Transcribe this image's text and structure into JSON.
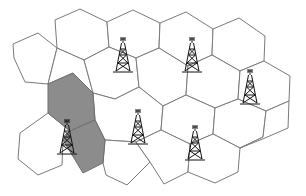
{
  "diagram": {
    "title": "",
    "colors": {
      "cell_fill": "#ffffff",
      "cell_stroke": "#7a7a7a",
      "shaded_fill": "#8c8c8c",
      "tower": "#111111"
    },
    "cells": [
      {
        "id": "c1",
        "points": "55,20 80,9 107,22 109,47 84,60 57,48",
        "shaded": false
      },
      {
        "id": "c2",
        "points": "107,22 133,10 160,23 159,48 136,58 109,47",
        "shaded": false
      },
      {
        "id": "c3",
        "points": "160,23 186,12 213,29 212,55 188,66 159,48",
        "shaded": false
      },
      {
        "id": "c4",
        "points": "213,29 239,18 265,36 264,61 240,71 212,55",
        "shaded": false
      },
      {
        "id": "c5",
        "points": "13,44 38,33 57,48 48,84 25,82 14,58",
        "shaded": false
      },
      {
        "id": "c6",
        "points": "57,48 84,60 93,93 73,73 48,84",
        "shaded": false
      },
      {
        "id": "c7",
        "points": "84,60 109,47 136,58 139,87 115,99 93,93",
        "shaded": false
      },
      {
        "id": "c8",
        "points": "136,58 159,48 188,66 186,95 163,106 139,87",
        "shaded": false
      },
      {
        "id": "c9",
        "points": "188,66 212,55 240,71 238,99 215,108 186,95",
        "shaded": false
      },
      {
        "id": "c10",
        "points": "240,71 264,61 290,76 289,101 266,111 238,99",
        "shaded": false
      },
      {
        "id": "c11",
        "points": "48,84 73,73 93,93 95,120 70,131 48,113",
        "shaded": true
      },
      {
        "id": "c12",
        "points": "95,120 70,131 63,140 83,173 103,163 105,140",
        "shaded": true
      },
      {
        "id": "c13",
        "points": "20,133 48,113 70,131 63,140 62,165 38,175 18,159",
        "shaded": false
      },
      {
        "id": "c14",
        "points": "93,93 115,99 139,87 163,106 161,130 136,142 105,140 95,120",
        "shaded": false
      },
      {
        "id": "c15",
        "points": "163,106 186,95 215,108 213,134 190,144 161,130",
        "shaded": false
      },
      {
        "id": "c16",
        "points": "215,108 238,99 266,111 263,137 240,148 213,134",
        "shaded": false
      },
      {
        "id": "c17",
        "points": "105,140 136,142 150,162 127,185 106,175 103,163",
        "shaded": false
      },
      {
        "id": "c18",
        "points": "136,142 161,130 190,144 188,172 164,184 150,162",
        "shaded": false
      },
      {
        "id": "c19",
        "points": "190,144 213,134 240,148 238,172 215,183 188,172",
        "shaded": false
      },
      {
        "id": "c20",
        "points": "240,148 263,137 266,111 289,101 288,128 265,138",
        "shaded": false
      }
    ],
    "towers": [
      {
        "id": "t1",
        "x": 123,
        "y": 37,
        "label": ""
      },
      {
        "id": "t2",
        "x": 192,
        "y": 37,
        "label": ""
      },
      {
        "id": "t3",
        "x": 250,
        "y": 69,
        "label": ""
      },
      {
        "id": "t4",
        "x": 67,
        "y": 119,
        "label": ""
      },
      {
        "id": "t5",
        "x": 138,
        "y": 109,
        "label": ""
      },
      {
        "id": "t6",
        "x": 195,
        "y": 125,
        "label": ""
      }
    ]
  }
}
